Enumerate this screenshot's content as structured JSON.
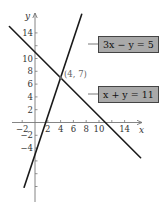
{
  "chart_data": {
    "type": "line",
    "title": "",
    "xlabel": "x",
    "ylabel": "y",
    "xlim": [
      -4,
      17
    ],
    "ylim": [
      -12,
      17
    ],
    "grid": false,
    "x_ticks": [
      -2,
      2,
      4,
      6,
      8,
      10,
      14
    ],
    "y_ticks": [
      -4,
      -2,
      2,
      4,
      6,
      8,
      10,
      14
    ],
    "x_tick_marks": [
      -2,
      2,
      4,
      6,
      8,
      10,
      12,
      14
    ],
    "y_tick_marks": [
      -10,
      -8,
      -6,
      -4,
      -2,
      2,
      4,
      6,
      8,
      10,
      12,
      14
    ],
    "series": [
      {
        "name": "3x − y = 5",
        "equation": "y = 3x - 5",
        "x": [
          -1.7,
          7.3
        ],
        "y": [
          -10.1,
          16.9
        ],
        "color": "#1a1a1a"
      },
      {
        "name": "x + y = 11",
        "equation": "y = -x + 11",
        "x": [
          -4,
          16.5
        ],
        "y": [
          15,
          -5.5
        ],
        "color": "#1a1a1a"
      }
    ],
    "annotations": [
      {
        "text": "(4, 7)",
        "x": 4,
        "y": 7,
        "type": "intersection-point"
      }
    ],
    "legend": {
      "position": "inline-boxes-right"
    }
  },
  "labels": {
    "x_axis": "x",
    "y_axis": "y",
    "line1": "3x − y = 5",
    "line2": "x + y = 11",
    "point": "(4, 7)"
  },
  "colors": {
    "line": "#1a1a1a",
    "axis": "#777777",
    "label_box_fill": "#a9a9a9",
    "label_box_border": "#444444"
  }
}
